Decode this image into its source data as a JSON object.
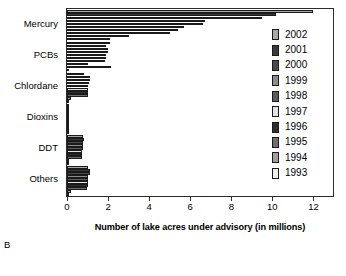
{
  "panel": {
    "label": "B"
  },
  "chart_data": {
    "type": "bar",
    "orientation": "horizontal",
    "title": "",
    "subtitle": "",
    "xlabel": "Number of lake acres under advisory (in millions)",
    "ylabel": "",
    "xlim": [
      0,
      13
    ],
    "xticks": [
      0,
      2,
      4,
      6,
      8,
      10,
      12
    ],
    "xtick_labels": [
      "0",
      "2",
      "4",
      "6",
      "8",
      "10",
      "12"
    ],
    "grid": false,
    "legend_position": "right",
    "categories": [
      "Mercury",
      "PCBs",
      "Chlordane",
      "Dioxins",
      "DDT",
      "Others"
    ],
    "series": [
      {
        "name": "2002",
        "color": "#a8a8a8",
        "values": [
          12.0,
          2.1,
          0.85,
          0.02,
          0.8,
          1.0
        ]
      },
      {
        "name": "2001",
        "color": "#3a3a3a",
        "values": [
          10.2,
          1.9,
          1.1,
          0.02,
          0.85,
          1.1
        ]
      },
      {
        "name": "2000",
        "color": "#4a4a4a",
        "values": [
          9.5,
          2.0,
          1.1,
          0.02,
          0.8,
          1.1
        ]
      },
      {
        "name": "1999",
        "color": "#8c8c8c",
        "values": [
          6.7,
          2.0,
          1.05,
          0.02,
          0.8,
          1.0
        ]
      },
      {
        "name": "1998",
        "color": "#5c5c5c",
        "values": [
          6.6,
          1.9,
          1.0,
          0.02,
          0.8,
          1.0
        ]
      },
      {
        "name": "1997",
        "color": "#e2e2e2",
        "values": [
          5.7,
          1.9,
          1.0,
          0.02,
          0.75,
          1.0
        ]
      },
      {
        "name": "1996",
        "color": "#2e2e2e",
        "values": [
          5.4,
          1.85,
          1.0,
          0.02,
          0.75,
          1.0
        ]
      },
      {
        "name": "1995",
        "color": "#6e6e6e",
        "values": [
          5.0,
          1.0,
          1.0,
          0.02,
          0.75,
          0.95
        ]
      },
      {
        "name": "1994",
        "color": "#9e9e9e",
        "values": [
          3.0,
          2.15,
          0.2,
          0.02,
          0.1,
          0.2
        ]
      },
      {
        "name": "1993",
        "color": "#f0f0f0",
        "values": [
          2.1,
          0.1,
          0.05,
          0.02,
          0.05,
          0.1
        ]
      }
    ]
  }
}
